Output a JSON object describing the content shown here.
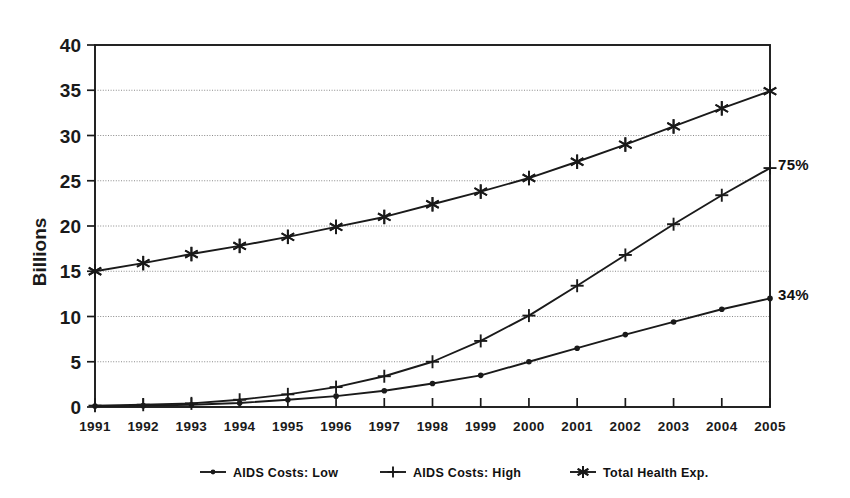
{
  "chart_data": {
    "type": "line",
    "title": "",
    "subtitle": "",
    "xlabel": "",
    "ylabel": "Billions",
    "x": [
      1991,
      1992,
      1993,
      1994,
      1995,
      1996,
      1997,
      1998,
      1999,
      2000,
      2001,
      2002,
      2003,
      2004,
      2005
    ],
    "categories": [
      "1991",
      "1992",
      "1993",
      "1994",
      "1995",
      "1996",
      "1997",
      "1998",
      "1999",
      "2000",
      "2001",
      "2002",
      "2003",
      "2004",
      "2005"
    ],
    "xlim": [
      1991,
      2005
    ],
    "ylim": [
      0,
      40
    ],
    "yticks": [
      0,
      5,
      10,
      15,
      20,
      25,
      30,
      35,
      40
    ],
    "ytick_labels": [
      "0",
      "5",
      "10",
      "15",
      "20",
      "25",
      "30",
      "35",
      "40"
    ],
    "grid": true,
    "legend_position": "bottom",
    "series": [
      {
        "name": "AIDS Costs: Low",
        "marker": "dot",
        "values": [
          0.1,
          0.15,
          0.25,
          0.45,
          0.8,
          1.2,
          1.8,
          2.6,
          3.5,
          5.0,
          6.5,
          8.0,
          9.4,
          10.8,
          12.0
        ]
      },
      {
        "name": "AIDS Costs: High",
        "marker": "plus",
        "values": [
          0.15,
          0.25,
          0.4,
          0.8,
          1.4,
          2.2,
          3.4,
          5.0,
          7.3,
          10.1,
          13.4,
          16.8,
          20.2,
          23.4,
          26.4
        ]
      },
      {
        "name": "Total Health Exp.",
        "marker": "asterisk",
        "values": [
          15.0,
          15.9,
          16.9,
          17.8,
          18.8,
          19.9,
          21.0,
          22.4,
          23.8,
          25.3,
          27.1,
          29.0,
          31.0,
          33.0,
          34.9
        ]
      }
    ],
    "annotations": [
      {
        "text": "75%",
        "series": "AIDS Costs: High",
        "x": 2005,
        "y": 26.4
      },
      {
        "text": "34%",
        "series": "AIDS Costs: Low",
        "x": 2005,
        "y": 12.0
      }
    ],
    "legend": [
      {
        "label": "AIDS Costs: Low",
        "marker": "dot"
      },
      {
        "label": "AIDS Costs: High",
        "marker": "plus"
      },
      {
        "label": "Total Health Exp.",
        "marker": "asterisk"
      }
    ],
    "colors": {
      "line": "#1a1a1a",
      "grid": "#8a8a8a",
      "axis": "#1a1a1a",
      "background": "#ffffff"
    }
  }
}
